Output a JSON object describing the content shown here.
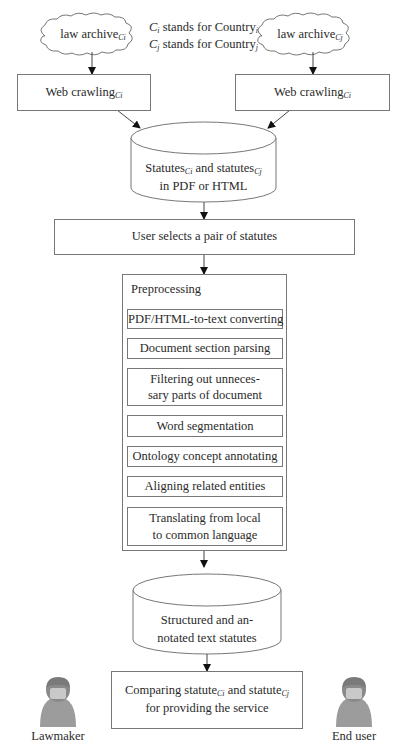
{
  "legend": {
    "line1": {
      "var": "C",
      "var_sub": "i",
      "text": " stands for Country",
      "text_sub": "i"
    },
    "line2": {
      "var": "C",
      "var_sub": "j",
      "text": " stands for Country",
      "text_sub": "j"
    }
  },
  "clouds": [
    {
      "label": "law archive",
      "sub": "Ci"
    },
    {
      "label": "law archive",
      "sub": "Cj"
    }
  ],
  "crawlers": [
    {
      "label": "Web crawling",
      "sub": "Ci"
    },
    {
      "label": "Web crawling",
      "sub": "Ci"
    }
  ],
  "db_raw": {
    "line1_a": "Statutes",
    "line1_a_sub": "Ci",
    "line1_b": " and statutes",
    "line1_b_sub": "Cj",
    "line2": "in PDF or HTML"
  },
  "user_select": {
    "label": "User selects a pair of statutes"
  },
  "preprocessing": {
    "title": "Preprocessing",
    "steps": [
      {
        "line1": "PDF/HTML-to-text converting"
      },
      {
        "line1": "Document section parsing"
      },
      {
        "line1": "Filtering out unneces-",
        "line2": "sary parts of document"
      },
      {
        "line1": "Word segmentation"
      },
      {
        "line1": "Ontology concept annotating"
      },
      {
        "line1": "Aligning related entities"
      },
      {
        "line1": "Translating from local",
        "line2": "to common language"
      }
    ]
  },
  "db_structured": {
    "line1": "Structured and an-",
    "line2": "notated text statutes"
  },
  "compare": {
    "line1_a": "Comparing statute",
    "line1_a_sub": "Ci",
    "line1_b": " and statute",
    "line1_b_sub": "Cj",
    "line2": "for providing the service"
  },
  "actors": [
    {
      "label": "Lawmaker",
      "icon": "person-icon"
    },
    {
      "label": "End user",
      "icon": "person-icon"
    }
  ],
  "colors": {
    "stroke": "#777777",
    "text": "#2a2a2a",
    "avatar_body": "#9a9a9a",
    "avatar_face": "#c8c8c8"
  }
}
